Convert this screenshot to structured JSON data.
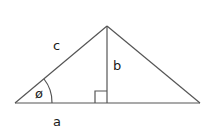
{
  "diagram": {
    "type": "right-triangle-altitude",
    "labels": {
      "hypotenuse": "c",
      "height": "b",
      "base": "a",
      "angle": "ø"
    },
    "colors": {
      "line": "#555555",
      "text": "#1a1a1a",
      "background": "#ffffff"
    }
  }
}
